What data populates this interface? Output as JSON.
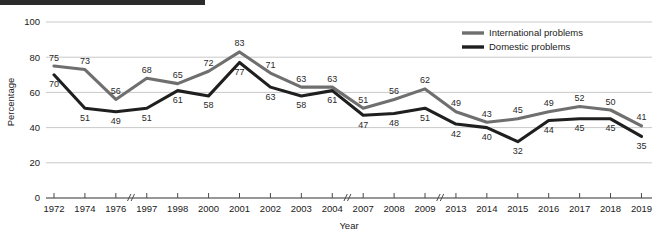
{
  "chart_data": {
    "type": "line",
    "title": "",
    "xlabel": "Year",
    "ylabel": "Percentage",
    "ylim": [
      0,
      100
    ],
    "yticks": [
      0,
      20,
      40,
      60,
      80,
      100
    ],
    "grid": true,
    "legend_position": "top-right",
    "axis_breaks_after": [
      "1976",
      "2004",
      "2009"
    ],
    "categories": [
      "1972",
      "1974",
      "1976",
      "1997",
      "1998",
      "2000",
      "2001",
      "2002",
      "2003",
      "2004",
      "2007",
      "2008",
      "2009",
      "2013",
      "2014",
      "2015",
      "2016",
      "2017",
      "2018",
      "2019"
    ],
    "series": [
      {
        "name": "International problems",
        "color": "#6f6f6f",
        "values": [
          75,
          73,
          56,
          68,
          65,
          72,
          83,
          71,
          63,
          63,
          51,
          56,
          62,
          49,
          43,
          45,
          49,
          52,
          50,
          41
        ]
      },
      {
        "name": "Domestic problems",
        "color": "#1f1f1f",
        "values": [
          70,
          51,
          49,
          51,
          61,
          58,
          77,
          63,
          58,
          61,
          47,
          48,
          51,
          42,
          40,
          32,
          44,
          45,
          45,
          35
        ]
      }
    ]
  },
  "legend": {
    "items": [
      {
        "label": "International problems"
      },
      {
        "label": "Domestic problems"
      }
    ]
  },
  "axes": {
    "y_title": "Percentage",
    "x_title": "Year",
    "y_tick_labels": [
      "0",
      "20",
      "40",
      "60",
      "80",
      "100"
    ],
    "x_tick_labels": [
      "1972",
      "1974",
      "1976",
      "1997",
      "1998",
      "2000",
      "2001",
      "2002",
      "2003",
      "2004",
      "2007",
      "2008",
      "2009",
      "2013",
      "2014",
      "2015",
      "2016",
      "2017",
      "2018",
      "2019"
    ]
  },
  "colors": {
    "international": "#6f6f6f",
    "domestic": "#1f1f1f",
    "grid": "#c9c9c9",
    "axis": "#4a4a4a",
    "top_bar": "#2b2b2b"
  }
}
